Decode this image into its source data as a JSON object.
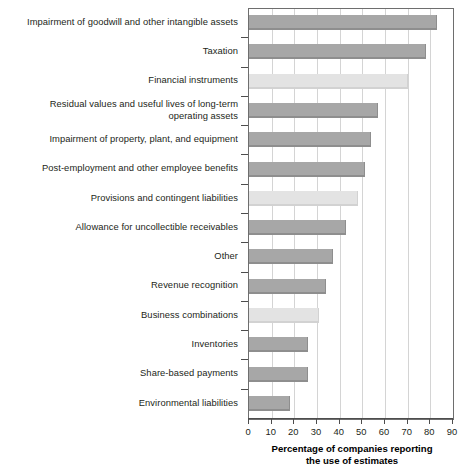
{
  "chart_data": {
    "type": "bar",
    "orientation": "horizontal",
    "title": "",
    "xlabel": "Percentage of companies reporting the use of estimates",
    "ylabel": "",
    "xlim": [
      0,
      90
    ],
    "xticks": [
      0,
      10,
      20,
      30,
      40,
      50,
      60,
      70,
      80,
      90
    ],
    "grid": true,
    "legend": false,
    "categories": [
      "Impairment of goodwill and other intangible assets",
      "Taxation",
      "Financial instruments",
      "Residual values and useful lives of long-term\noperating assets",
      "Impairment of property, plant, and equipment",
      "Post-employment and other employee benefits",
      "Provisions and contingent liabilities",
      "Allowance for uncollectible receivables",
      "Other",
      "Revenue recognition",
      "Business combinations",
      "Inventories",
      "Share-based payments",
      "Environmental liabilities"
    ],
    "values": [
      83,
      78,
      70,
      57,
      54,
      51,
      48,
      43,
      37,
      34,
      31,
      26,
      26,
      18
    ],
    "bar_shades": [
      "dark",
      "dark",
      "light",
      "dark",
      "dark",
      "dark",
      "light",
      "dark",
      "dark",
      "dark",
      "light",
      "dark",
      "dark",
      "dark"
    ],
    "colors": {
      "bar_dark": "#a7a7a7",
      "bar_light": "#e3e3e3",
      "bar_dark_shadow": "#8e8e8e",
      "bar_light_shadow": "#d2d2d2",
      "gridline": "#d4d4d4",
      "axis": "#4d4d4d",
      "frame": "#6e6e6e",
      "text": "#231f20",
      "background": "#ffffff"
    }
  },
  "axis_title": {
    "line1": "Percentage of companies reporting",
    "line2": "the use of estimates"
  }
}
